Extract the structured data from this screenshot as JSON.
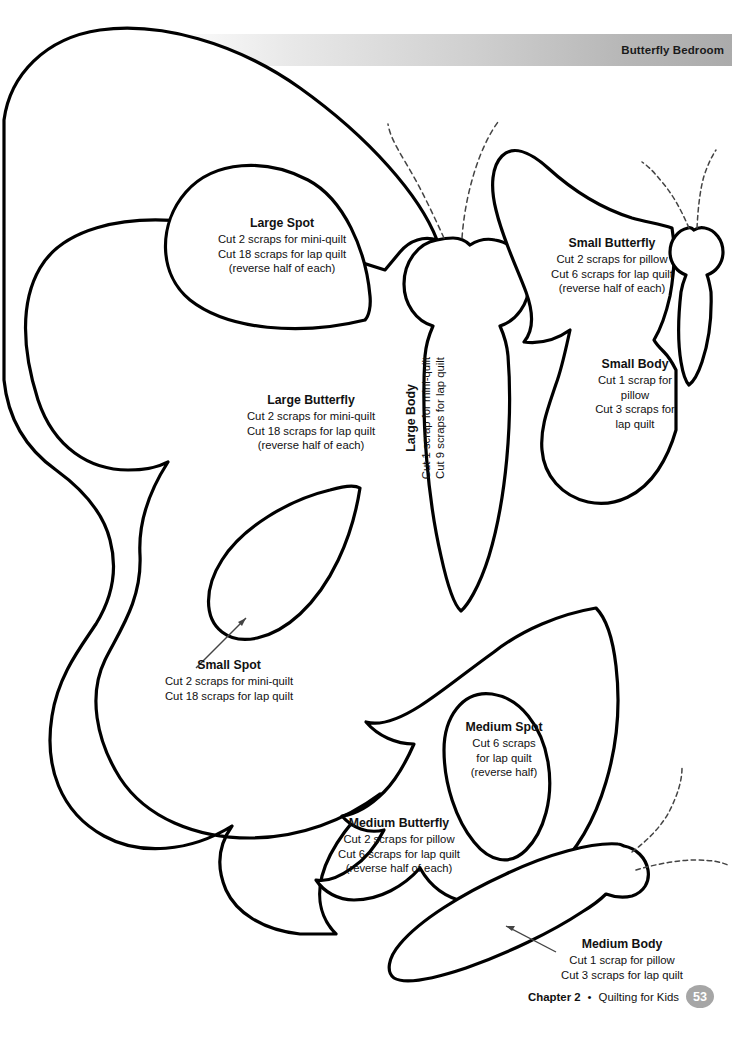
{
  "header": {
    "title": "Butterfly Bedroom"
  },
  "footer": {
    "chapter": "Chapter 2",
    "separator": "•",
    "book_title": "Quilting for Kids",
    "page_number": "53",
    "page_number_bg": "#a6a6a6"
  },
  "labels": {
    "large_spot": {
      "title": "Large Spot",
      "line1": "Cut 2 scraps for mini-quilt",
      "line2": "Cut 18 scraps for lap quilt",
      "line3": "(reverse half of each)"
    },
    "large_butterfly": {
      "title": "Large Butterfly",
      "line1": "Cut 2 scraps for mini-quilt",
      "line2": "Cut 18 scraps for lap quilt",
      "line3": "(reverse half of each)"
    },
    "large_body": {
      "title": "Large Body",
      "line1": "Cut 1 scrap for mini-quilt",
      "line2": "Cut 9 scraps for lap quilt"
    },
    "small_butterfly": {
      "title": "Small Butterfly",
      "line1": "Cut 2 scraps for pillow",
      "line2": "Cut 6 scraps for lap quilt",
      "line3": "(reverse half of each)"
    },
    "small_body": {
      "title": "Small Body",
      "line1": "Cut 1 scrap for",
      "line2": "pillow",
      "line3": "Cut 3 scraps for",
      "line4": "lap quilt"
    },
    "small_spot": {
      "title": "Small Spot",
      "line1": "Cut 2 scraps for mini-quilt",
      "line2": "Cut 18 scraps for lap quilt"
    },
    "medium_spot": {
      "title": "Medium Spot",
      "line1": "Cut 6 scraps",
      "line2": "for lap quilt",
      "line3": "(reverse half)"
    },
    "medium_butterfly": {
      "title": "Medium Butterfly",
      "line1": "Cut 2 scraps for pillow",
      "line2": "Cut 6 scraps for lap quilt",
      "line3": "(reverse half of each)"
    },
    "medium_body": {
      "title": "Medium Body",
      "line1": "Cut 1 scrap for pillow",
      "line2": "Cut 3 scraps for lap quilt"
    }
  },
  "artwork": {
    "stroke_color": "#000000",
    "fill_color": "#ffffff",
    "antenna_style": "dashed",
    "shapes": [
      "large-butterfly-wing",
      "large-spot",
      "large-body",
      "small-butterfly-wing",
      "small-body",
      "small-spot",
      "medium-butterfly-wing",
      "medium-spot",
      "medium-body"
    ]
  }
}
